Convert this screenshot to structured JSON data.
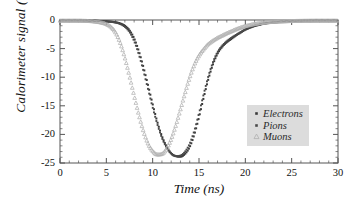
{
  "chart_data": {
    "type": "scatter",
    "title": "",
    "xlabel": "Time (ns)",
    "ylabel": "Calorimeter signal (a.u.)",
    "xlim": [
      0,
      30
    ],
    "ylim": [
      -25,
      0
    ],
    "xticks": [
      "0",
      "5",
      "10",
      "15",
      "20",
      "25",
      "30"
    ],
    "xtick_values": [
      0,
      5,
      10,
      15,
      20,
      25,
      30
    ],
    "yticks": [
      "0",
      "-5",
      "-10",
      "-15",
      "-20",
      "-25"
    ],
    "ytick_values": [
      0,
      -5,
      -10,
      -15,
      -20,
      -25
    ],
    "minor_tick_step_x": 1,
    "minor_tick_step_y": 1,
    "grid": false,
    "legend_position": "center-right",
    "series": [
      {
        "name": "Electrons",
        "marker": "filled-square",
        "color": "#3a3a3a",
        "x": [
          0,
          0.5,
          1,
          1.5,
          2,
          2.5,
          3,
          3.5,
          4,
          4.5,
          5,
          5.5,
          6,
          6.5,
          7,
          7.5,
          8,
          8.5,
          9,
          9.5,
          10,
          10.5,
          11,
          11.5,
          12,
          12.5,
          13,
          13.5,
          14,
          14.5,
          15,
          15.5,
          16,
          16.5,
          17,
          17.5,
          18,
          18.5,
          19,
          19.5,
          20,
          20.5,
          21,
          21.5,
          22,
          23,
          24,
          25,
          26,
          27,
          28,
          29,
          30
        ],
        "y": [
          -0.1,
          -0.1,
          -0.1,
          -0.1,
          -0.1,
          -0.1,
          -0.1,
          -0.1,
          -0.15,
          -0.2,
          -0.25,
          -0.3,
          -0.4,
          -0.6,
          -1.0,
          -1.8,
          -3.2,
          -5.4,
          -8.2,
          -11.4,
          -14.7,
          -17.8,
          -20.3,
          -22.1,
          -23.3,
          -23.8,
          -23.9,
          -23.4,
          -22.2,
          -20.0,
          -17.0,
          -13.6,
          -10.4,
          -7.8,
          -5.9,
          -4.7,
          -3.9,
          -3.3,
          -2.7,
          -2.2,
          -1.7,
          -1.35,
          -1.05,
          -0.85,
          -0.65,
          -0.45,
          -0.3,
          -0.2,
          -0.15,
          -0.12,
          -0.1,
          -0.1,
          -0.1
        ]
      },
      {
        "name": "Pions",
        "marker": "filled-square",
        "color": "#4a4a4a",
        "x": [
          0,
          0.5,
          1,
          1.5,
          2,
          2.5,
          3,
          3.5,
          4,
          4.5,
          5,
          5.5,
          6,
          6.5,
          7,
          7.5,
          8,
          8.5,
          9,
          9.5,
          10,
          10.5,
          11,
          11.5,
          12,
          12.5,
          13,
          13.5,
          14,
          14.5,
          15,
          15.5,
          16,
          16.5,
          17,
          17.5,
          18,
          18.5,
          19,
          19.5,
          20,
          20.5,
          21,
          21.5,
          22,
          23,
          24,
          25,
          26,
          27,
          28,
          29,
          30
        ],
        "y": [
          -0.1,
          -0.1,
          -0.1,
          -0.1,
          -0.1,
          -0.1,
          -0.1,
          -0.1,
          -0.15,
          -0.2,
          -0.25,
          -0.32,
          -0.45,
          -0.7,
          -1.2,
          -2.1,
          -3.7,
          -6.0,
          -8.9,
          -12.1,
          -15.3,
          -18.2,
          -20.6,
          -22.3,
          -23.4,
          -23.8,
          -23.7,
          -23.0,
          -21.6,
          -19.3,
          -16.3,
          -13.0,
          -9.9,
          -7.4,
          -5.6,
          -4.5,
          -3.7,
          -3.1,
          -2.6,
          -2.1,
          -1.65,
          -1.3,
          -1.0,
          -0.8,
          -0.6,
          -0.42,
          -0.28,
          -0.2,
          -0.15,
          -0.12,
          -0.1,
          -0.1,
          -0.1
        ]
      },
      {
        "name": "Muons",
        "marker": "open-triangle",
        "color": "#b0b0b0",
        "x": [
          0,
          0.5,
          1,
          1.5,
          2,
          2.5,
          3,
          3.5,
          4,
          4.5,
          5,
          5.5,
          6,
          6.5,
          7,
          7.5,
          8,
          8.5,
          9,
          9.5,
          10,
          10.5,
          11,
          11.5,
          12,
          12.5,
          13,
          13.5,
          14,
          14.5,
          15,
          15.5,
          16,
          16.5,
          17,
          17.5,
          18,
          18.5,
          19,
          19.5,
          20,
          20.5,
          21,
          21.5,
          22,
          23,
          24,
          25,
          26,
          27,
          28,
          29,
          30
        ],
        "y": [
          -0.1,
          -0.1,
          -0.1,
          -0.1,
          -0.1,
          -0.12,
          -0.15,
          -0.2,
          -0.3,
          -0.45,
          -0.7,
          -1.2,
          -2.2,
          -4.0,
          -6.6,
          -9.8,
          -13.2,
          -16.5,
          -19.4,
          -21.6,
          -22.9,
          -23.5,
          -23.4,
          -22.5,
          -20.8,
          -18.4,
          -15.6,
          -12.7,
          -10.0,
          -7.8,
          -6.2,
          -5.1,
          -4.2,
          -3.6,
          -3.1,
          -2.7,
          -2.3,
          -1.95,
          -1.6,
          -1.3,
          -1.05,
          -0.85,
          -0.68,
          -0.55,
          -0.44,
          -0.3,
          -0.22,
          -0.16,
          -0.13,
          -0.11,
          -0.1,
          -0.1,
          -0.1
        ]
      }
    ],
    "annotations": [
      {
        "text": "Muons pulse minimum near t = 11 ns, amplitude about -23.5 a.u."
      },
      {
        "text": "Electrons and Pions pulse minimum near t = 12.6 ns, amplitude about -23.8 a.u."
      }
    ]
  },
  "legend": {
    "entries": [
      {
        "label": "Electrons",
        "marker": "filled-square"
      },
      {
        "label": "Pions",
        "marker": "filled-square"
      },
      {
        "label": "Muons",
        "marker": "open-triangle"
      }
    ],
    "background_color": "#dcdcdc"
  },
  "axes": {
    "frame_color": "#555555"
  }
}
